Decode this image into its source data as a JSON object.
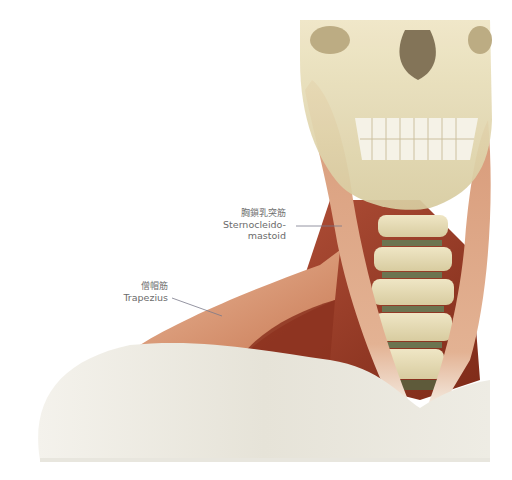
{
  "figure": {
    "labels": [
      {
        "id": "scm",
        "jp": "胸鎖乳突筋",
        "en_line1": "Sternocleido-",
        "en_line2": "mastoid"
      },
      {
        "id": "trapezius",
        "jp": "僧帽筋",
        "en_line1": "Trapezius"
      }
    ],
    "colors": {
      "bone": "#e6dcb4",
      "bone_shadow": "#c8b98a",
      "muscle_light": "#e0a583",
      "muscle_dark": "#9e3a22",
      "tendon": "#f3ede4",
      "skin_pale": "#ebe9e0",
      "leader_line": "#7a7a8a",
      "text": "#6b6b6b"
    }
  }
}
